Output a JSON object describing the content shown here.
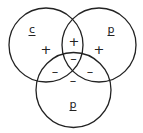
{
  "caption": "",
  "diagram": {
    "type": "venn",
    "circles": [
      {
        "id": "left",
        "label": "c",
        "cx": 46,
        "cy": 45,
        "r": 37
      },
      {
        "id": "right",
        "label": "p",
        "cx": 99,
        "cy": 45,
        "r": 37
      },
      {
        "id": "bottom",
        "label": "p",
        "cx": 73.5,
        "cy": 90,
        "r": 37.5
      }
    ],
    "regions": [
      {
        "region": "left-only",
        "sign": "+"
      },
      {
        "region": "right-only",
        "sign": "+"
      },
      {
        "region": "left-right",
        "sign": "+"
      },
      {
        "region": "center",
        "sign": "–"
      },
      {
        "region": "left-bottom",
        "sign": "–"
      },
      {
        "region": "right-bottom",
        "sign": "–"
      },
      {
        "region": "bottom-top",
        "sign": "–"
      }
    ]
  }
}
